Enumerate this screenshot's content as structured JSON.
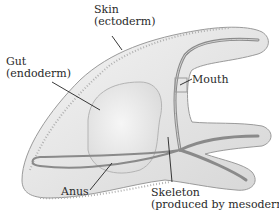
{
  "diagram": {
    "labels": {
      "skin": {
        "line1": "Skin",
        "line2": "(ectoderm)"
      },
      "gut": {
        "line1": "Gut",
        "line2": "(endoderm)"
      },
      "mouth": {
        "line1": "Mouth"
      },
      "anus": {
        "line1": "Anus"
      },
      "skeleton": {
        "line1": "Skeleton",
        "line2": "(produced by mesoderm)"
      }
    },
    "colors": {
      "body_fill": "#e9e9e9",
      "body_edge": "#9a9a9a",
      "skeleton": "#8a8a8a",
      "leader_line": "#222222",
      "text": "#2a2a2a"
    }
  }
}
